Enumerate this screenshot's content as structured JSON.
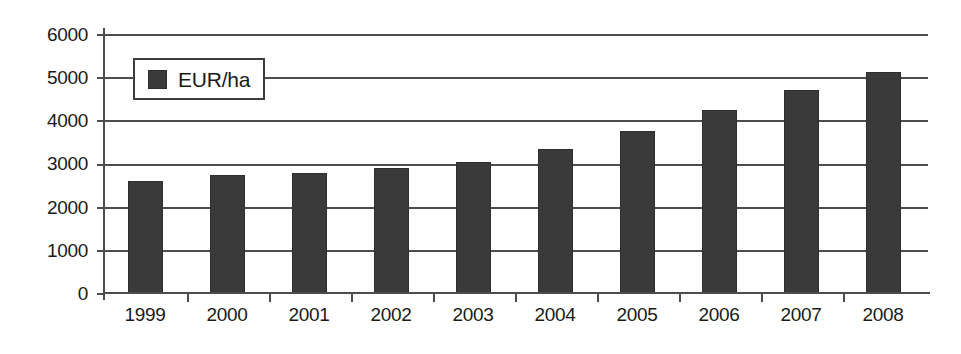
{
  "chart_data": {
    "type": "bar",
    "title": "",
    "subtitle": "",
    "xlabel": "",
    "ylabel": "",
    "categories": [
      "1999",
      "2000",
      "2001",
      "2002",
      "2003",
      "2004",
      "2005",
      "2006",
      "2007",
      "2008"
    ],
    "series": [
      {
        "name": "EUR/ha",
        "color": "#3a3a3a",
        "values": [
          2600,
          2730,
          2780,
          2890,
          3040,
          3330,
          3760,
          4250,
          4700,
          5120
        ]
      }
    ],
    "ylim": [
      0,
      6000
    ],
    "yticks": [
      0,
      1000,
      2000,
      3000,
      4000,
      5000,
      6000
    ],
    "ytick_labels": [
      "0",
      "1000",
      "2000",
      "3000",
      "4000",
      "5000",
      "6000"
    ],
    "grid": true,
    "grid_axis": "y",
    "legend": {
      "position": "top-left-inside",
      "entries": [
        {
          "label": "EUR/ha",
          "color": "#3a3a3a"
        }
      ]
    },
    "colors": {
      "bar_fill": "#3a3a3a",
      "axis": "#4d4d4d",
      "gridline": "#4d4d4d",
      "text": "#1a1a1a",
      "background": "#ffffff",
      "legend_border": "#3d3d3d"
    }
  }
}
